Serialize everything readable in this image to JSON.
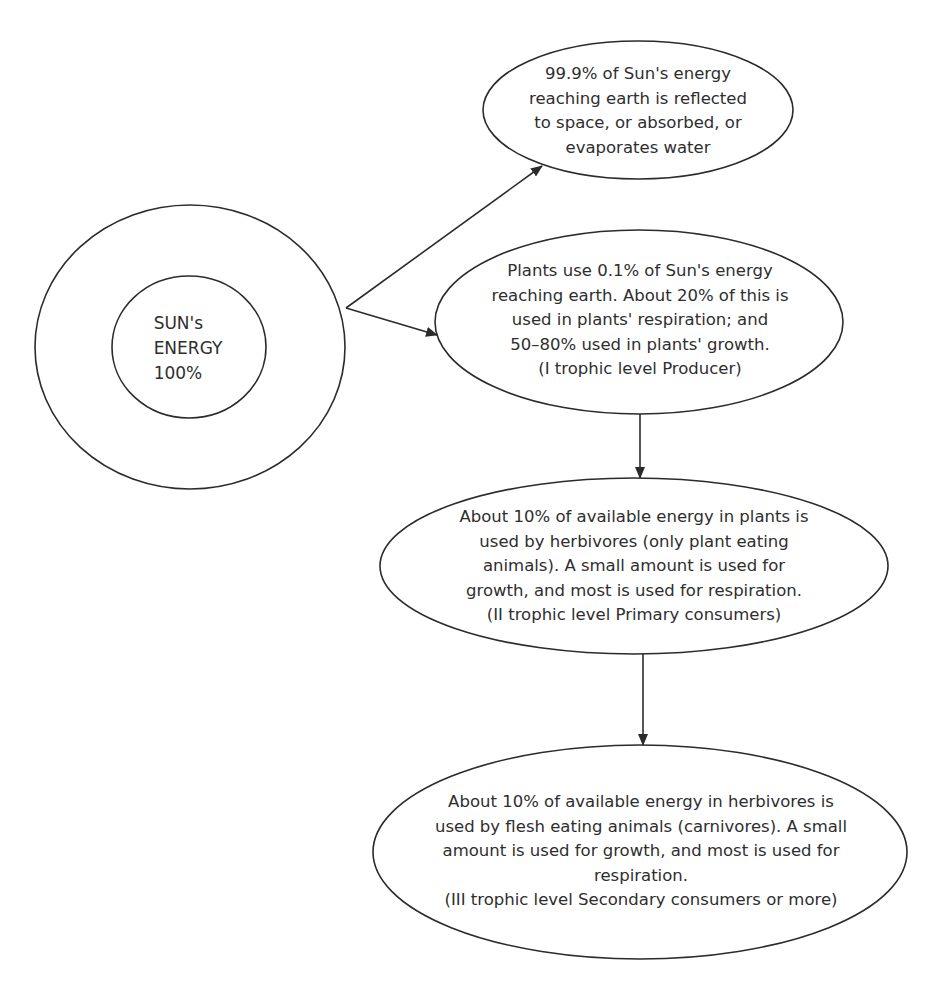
{
  "diagram": {
    "colors": {
      "stroke": "#2b2b2b",
      "text": "#2e2e2e",
      "background": "#ffffff"
    },
    "nodes": [
      {
        "id": "sun",
        "shape": "concentric-ellipses",
        "lines": [
          "SUN's",
          "ENERGY",
          "100%"
        ]
      },
      {
        "id": "reflected",
        "shape": "ellipse",
        "lines": [
          "99.9% of Sun's energy",
          "reaching earth is reflected",
          "to space, or absorbed, or",
          "evaporates water"
        ]
      },
      {
        "id": "producer",
        "shape": "ellipse",
        "lines": [
          "Plants use 0.1% of Sun's energy",
          "reaching earth. About 20% of this is",
          "used in plants' respiration; and",
          "50–80% used in plants' growth.",
          "(I trophic level Producer)"
        ]
      },
      {
        "id": "primary-consumers",
        "shape": "ellipse",
        "lines": [
          "About 10% of available energy in plants is",
          "used by herbivores (only plant eating",
          "animals). A small amount is used for",
          "growth, and most is used for respiration.",
          "(II trophic level Primary consumers)"
        ]
      },
      {
        "id": "secondary-consumers",
        "shape": "ellipse",
        "lines": [
          "About 10% of available energy in herbivores is",
          "used by flesh eating animals (carnivores). A small",
          "amount is used for growth, and most is used for",
          "respiration.",
          "(III trophic level Secondary consumers or more)"
        ]
      }
    ],
    "edges": [
      {
        "from": "sun",
        "to": "reflected"
      },
      {
        "from": "sun",
        "to": "producer"
      },
      {
        "from": "producer",
        "to": "primary-consumers"
      },
      {
        "from": "primary-consumers",
        "to": "secondary-consumers"
      }
    ]
  }
}
